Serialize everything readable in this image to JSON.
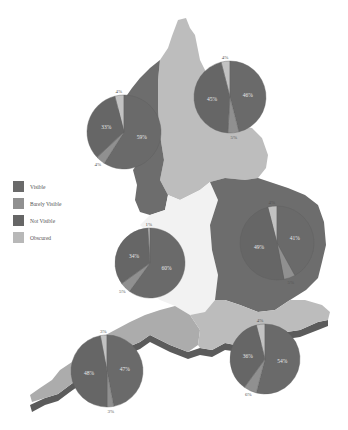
{
  "legend": {
    "items": [
      {
        "label": "Visible",
        "color": "#6a6a6a"
      },
      {
        "label": "Barely Visible",
        "color": "#909090"
      },
      {
        "label": "Not Visible",
        "color": "#666666"
      },
      {
        "label": "Obscured",
        "color": "#b8b8b8"
      }
    ]
  },
  "colors": {
    "region_light": "#bdbdbd",
    "region_mid": "#a9a9a9",
    "region_dark": "#6d6d6d",
    "region_white": "#f1f1f1",
    "pie_main": "#6a6a6a",
    "pie_barely": "#909090",
    "pie_obscured": "#c2c2c2",
    "shadow": "#5a5a5a"
  },
  "pies": [
    {
      "name": "north-west",
      "cx": 124,
      "cy": 132,
      "r": 37,
      "slices": [
        {
          "cat": "Obscured",
          "value": 4
        },
        {
          "cat": "Visible",
          "value": 59
        },
        {
          "cat": "Barely Visible",
          "value": 4
        },
        {
          "cat": "Not Visible",
          "value": 33
        }
      ],
      "labels": {
        "obscured": "4%",
        "right": "59%",
        "barely": "4%",
        "left": "33%"
      }
    },
    {
      "name": "north-east",
      "cx": 230,
      "cy": 97,
      "r": 36,
      "slices": [
        {
          "cat": "Obscured",
          "value": 4
        },
        {
          "cat": "Visible",
          "value": 46
        },
        {
          "cat": "Barely Visible",
          "value": 5
        },
        {
          "cat": "Not Visible",
          "value": 45
        }
      ],
      "labels": {
        "obscured": "4%",
        "right": "46%",
        "barely": "5%",
        "left": "45%"
      }
    },
    {
      "name": "midlands",
      "cx": 150,
      "cy": 263,
      "r": 35,
      "slices": [
        {
          "cat": "Obscured",
          "value": 1
        },
        {
          "cat": "Visible",
          "value": 60
        },
        {
          "cat": "Barely Visible",
          "value": 5
        },
        {
          "cat": "Not Visible",
          "value": 34
        }
      ],
      "labels": {
        "obscured": "1%",
        "right": "60%",
        "barely": "5%",
        "left": "34%"
      }
    },
    {
      "name": "east",
      "cx": 277,
      "cy": 243,
      "r": 37,
      "slices": [
        {
          "cat": "Obscured",
          "value": 4
        },
        {
          "cat": "Visible",
          "value": 42
        },
        {
          "cat": "Barely Visible",
          "value": 5
        },
        {
          "cat": "Not Visible",
          "value": 49
        }
      ],
      "labels": {
        "obscured": "4%",
        "right": "41%",
        "barely": "5%",
        "left": "49%"
      }
    },
    {
      "name": "south-west",
      "cx": 107,
      "cy": 371,
      "r": 36,
      "slices": [
        {
          "cat": "Obscured",
          "value": 3
        },
        {
          "cat": "Visible",
          "value": 47
        },
        {
          "cat": "Barely Visible",
          "value": 3
        },
        {
          "cat": "Not Visible",
          "value": 47
        }
      ],
      "labels": {
        "obscured": "3%",
        "right": "47%",
        "barely": "3%",
        "left": "48%"
      }
    },
    {
      "name": "south-east",
      "cx": 265,
      "cy": 359,
      "r": 35,
      "slices": [
        {
          "cat": "Obscured",
          "value": 4
        },
        {
          "cat": "Visible",
          "value": 54
        },
        {
          "cat": "Barely Visible",
          "value": 6
        },
        {
          "cat": "Not Visible",
          "value": 36
        }
      ],
      "labels": {
        "obscured": "4%",
        "right": "54%",
        "barely": "6%",
        "left": "36%"
      }
    }
  ]
}
